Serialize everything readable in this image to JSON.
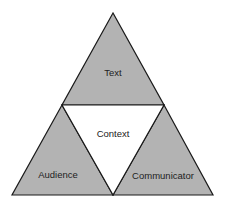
{
  "diagram": {
    "type": "triangle-of-triangles",
    "colors": {
      "fill_outer": "#b3b3b3",
      "fill_center": "#ffffff",
      "stroke": "#1a1a1a"
    },
    "nodes": [
      {
        "id": "text",
        "label": "Text",
        "position": "top"
      },
      {
        "id": "context",
        "label": "Context",
        "position": "center"
      },
      {
        "id": "audience",
        "label": "Audience",
        "position": "bottom-left"
      },
      {
        "id": "communicator",
        "label": "Communicator",
        "position": "bottom-right"
      }
    ]
  }
}
